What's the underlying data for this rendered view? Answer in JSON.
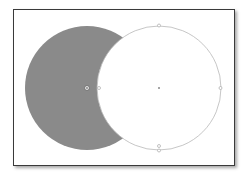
{
  "canvas": {
    "background": "#ffffff",
    "frame_border": "#3a3a3a"
  },
  "shapes": {
    "back_circle": {
      "cx": 87,
      "cy": 88,
      "r": 62,
      "fill": "#8a8a8a"
    },
    "front_circle": {
      "cx": 159,
      "cy": 88,
      "r": 62,
      "fill": "#ffffff",
      "stroke": "#b8b8b8"
    },
    "handles": {
      "color": "#9a9a9a",
      "selected_center": {
        "cx": 87,
        "cy": 88
      }
    }
  }
}
